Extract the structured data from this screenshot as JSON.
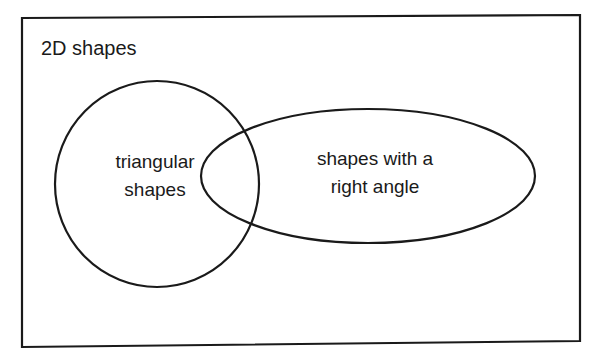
{
  "diagram": {
    "type": "venn",
    "universe": {
      "label": "2D shapes"
    },
    "sets": [
      {
        "id": "triangular",
        "label_lines": [
          "triangular",
          "shapes"
        ]
      },
      {
        "id": "right_angle",
        "label_lines": [
          "shapes with a",
          "right angle"
        ]
      }
    ],
    "relationships": [
      {
        "sets": [
          "triangular",
          "right_angle"
        ],
        "type": "overlap"
      }
    ],
    "colors": {
      "stroke": "#1a1a1a",
      "background": "#ffffff"
    }
  }
}
